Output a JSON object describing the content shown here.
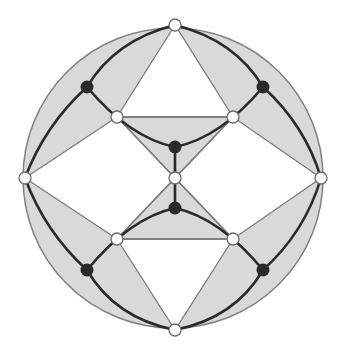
{
  "diagram": {
    "type": "planar-graph-on-disk",
    "circle": {
      "cx": 173,
      "cy": 178,
      "r": 150,
      "fill": "#d9d9d9",
      "stroke": "#808080"
    },
    "colors": {
      "shade": "#d9d9d9",
      "thin_line": "#7a7a7a",
      "thick_line": "#2a2a2a",
      "black_node": "#2a2a2a",
      "white_node": "#ffffff"
    },
    "white_nodes": [
      {
        "id": "top",
        "x": 175,
        "y": 25
      },
      {
        "id": "left",
        "x": 25,
        "y": 178
      },
      {
        "id": "right",
        "x": 321,
        "y": 178
      },
      {
        "id": "bottom",
        "x": 175,
        "y": 330
      },
      {
        "id": "center",
        "x": 175,
        "y": 178
      },
      {
        "id": "inner-tl",
        "x": 117,
        "y": 117
      },
      {
        "id": "inner-tr",
        "x": 233,
        "y": 117
      },
      {
        "id": "inner-bl",
        "x": 117,
        "y": 239
      },
      {
        "id": "inner-br",
        "x": 233,
        "y": 239
      }
    ],
    "black_nodes": [
      {
        "id": "b-tl",
        "x": 87,
        "y": 87
      },
      {
        "id": "b-tr",
        "x": 263,
        "y": 87
      },
      {
        "id": "b-bl",
        "x": 87,
        "y": 270
      },
      {
        "id": "b-br",
        "x": 263,
        "y": 270
      },
      {
        "id": "b-ctop",
        "x": 175,
        "y": 147
      },
      {
        "id": "b-cbot",
        "x": 175,
        "y": 208
      }
    ]
  }
}
